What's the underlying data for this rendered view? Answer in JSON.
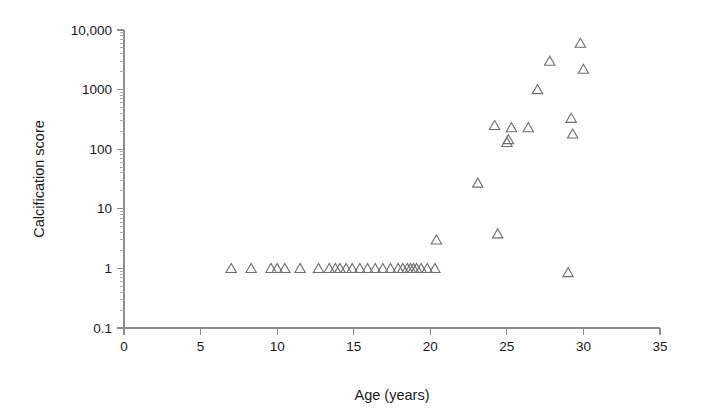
{
  "chart_data": {
    "type": "scatter",
    "title": "",
    "xlabel": "Age (years)",
    "ylabel": "Calcification score",
    "xlim": [
      0,
      35
    ],
    "ylim": [
      0.1,
      10000
    ],
    "yscale": "log",
    "xscale": "linear",
    "grid": false,
    "legend": null,
    "marker": "open-triangle-up",
    "marker_color": "#6e6e6e",
    "xticks": [
      0,
      5,
      10,
      15,
      20,
      25,
      30,
      35
    ],
    "xticklabels": [
      "0",
      "5",
      "10",
      "15",
      "20",
      "25",
      "30",
      "35"
    ],
    "yticks": [
      0.1,
      1,
      10,
      100,
      1000,
      10000
    ],
    "yticklabels": [
      "0.1",
      "1",
      "10",
      "100",
      "1000",
      "10,000"
    ],
    "minor_ticks": true,
    "series": [
      {
        "name": "patients",
        "points": [
          [
            7.0,
            1.0
          ],
          [
            8.3,
            1.0
          ],
          [
            9.6,
            1.0
          ],
          [
            10.0,
            1.0
          ],
          [
            10.5,
            1.0
          ],
          [
            11.5,
            1.0
          ],
          [
            12.7,
            1.0
          ],
          [
            13.4,
            1.0
          ],
          [
            13.8,
            1.0
          ],
          [
            14.1,
            1.0
          ],
          [
            14.5,
            1.0
          ],
          [
            14.9,
            1.0
          ],
          [
            15.4,
            1.0
          ],
          [
            15.9,
            1.0
          ],
          [
            16.4,
            1.0
          ],
          [
            16.9,
            1.0
          ],
          [
            17.4,
            1.0
          ],
          [
            17.9,
            1.0
          ],
          [
            18.2,
            1.0
          ],
          [
            18.5,
            1.0
          ],
          [
            18.7,
            1.0
          ],
          [
            18.9,
            1.0
          ],
          [
            19.1,
            1.0
          ],
          [
            19.4,
            1.0
          ],
          [
            19.8,
            1.0
          ],
          [
            20.3,
            1.0
          ],
          [
            20.4,
            3.0
          ],
          [
            23.1,
            27.0
          ],
          [
            24.4,
            3.8
          ],
          [
            24.2,
            250.0
          ],
          [
            25.1,
            145.0
          ],
          [
            25.3,
            230.0
          ],
          [
            25.0,
            130.0
          ],
          [
            26.4,
            230.0
          ],
          [
            27.0,
            1000.0
          ],
          [
            27.8,
            3000.0
          ],
          [
            29.0,
            0.85
          ],
          [
            29.2,
            330.0
          ],
          [
            29.3,
            180.0
          ],
          [
            29.8,
            6000.0
          ],
          [
            30.0,
            2200.0
          ]
        ]
      }
    ]
  },
  "axes": {
    "x_title": "Age (years)",
    "y_title": "Calcification score"
  }
}
